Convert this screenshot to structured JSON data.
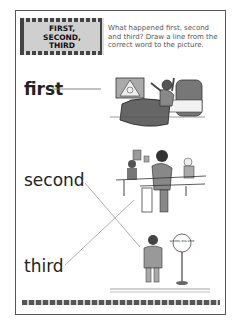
{
  "worksheet": {
    "title_lines": [
      "FIRST,",
      "SECOND,",
      "THIRD"
    ],
    "instructions": "What happened first, second and third? Draw a line from the correct word to the picture.",
    "labels": {
      "first": "first",
      "second": "second",
      "third": "third"
    },
    "pictures": {
      "bed": "child waking up and stretching in bed",
      "classroom": "children sitting at school desks",
      "bus_stop": "boy standing next to school bus stop sign"
    },
    "bus_stop_sign": "SCHOOL BUS STOP"
  },
  "colors": {
    "ink": "#222222",
    "frame": "#555555",
    "title_fill": "#cfcfcf",
    "lines": "#999999"
  }
}
